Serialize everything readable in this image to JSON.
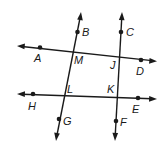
{
  "diagram": {
    "type": "geometry-lines",
    "lines": [
      {
        "id": "AD",
        "from": [
          18,
          46
        ],
        "to": [
          156,
          61
        ],
        "arrows": "both",
        "points": [
          "A",
          "M",
          "J",
          "D"
        ]
      },
      {
        "id": "HE",
        "from": [
          18,
          94
        ],
        "to": [
          156,
          99
        ],
        "arrows": "both",
        "points": [
          "H",
          "L",
          "K",
          "E"
        ]
      },
      {
        "id": "BG",
        "from": [
          81,
          13
        ],
        "to": [
          56,
          140
        ],
        "arrows": "both",
        "points": [
          "B",
          "M",
          "L",
          "G"
        ]
      },
      {
        "id": "CF",
        "from": [
          122,
          13
        ],
        "to": [
          115,
          140
        ],
        "arrows": "both",
        "points": [
          "C",
          "J",
          "K",
          "F"
        ]
      }
    ],
    "points": [
      {
        "name": "A",
        "x": 40,
        "y": 47.5,
        "dot": true,
        "label_x": 34,
        "label_y": 62
      },
      {
        "name": "B",
        "x": 77.5,
        "y": 32,
        "dot": true,
        "label_x": 82,
        "label_y": 36
      },
      {
        "name": "C",
        "x": 121,
        "y": 32,
        "dot": true,
        "label_x": 126,
        "label_y": 36
      },
      {
        "name": "D",
        "x": 141,
        "y": 60,
        "dot": true,
        "label_x": 136,
        "label_y": 75
      },
      {
        "name": "E",
        "x": 138,
        "y": 98,
        "dot": true,
        "label_x": 132,
        "label_y": 113
      },
      {
        "name": "F",
        "x": 116,
        "y": 121,
        "dot": true,
        "label_x": 120,
        "label_y": 126
      },
      {
        "name": "G",
        "x": 59,
        "y": 119,
        "dot": true,
        "label_x": 63,
        "label_y": 125
      },
      {
        "name": "H",
        "x": 33,
        "y": 94,
        "dot": true,
        "label_x": 28,
        "label_y": 110
      },
      {
        "name": "M",
        "x": 72,
        "y": 51,
        "dot": false,
        "label_x": 74,
        "label_y": 64
      },
      {
        "name": "J",
        "x": 118,
        "y": 56,
        "dot": false,
        "label_x": 110,
        "label_y": 69
      },
      {
        "name": "L",
        "x": 64,
        "y": 96,
        "dot": false,
        "label_x": 67,
        "label_y": 93
      },
      {
        "name": "K",
        "x": 117,
        "y": 97.5,
        "dot": false,
        "label_x": 107,
        "label_y": 93
      }
    ],
    "labels": {
      "A": "A",
      "B": "B",
      "C": "C",
      "D": "D",
      "E": "E",
      "F": "F",
      "G": "G",
      "H": "H",
      "M": "M",
      "J": "J",
      "L": "L",
      "K": "K"
    },
    "colors": {
      "ink": "#1a1a1a",
      "background": "#ffffff"
    }
  }
}
